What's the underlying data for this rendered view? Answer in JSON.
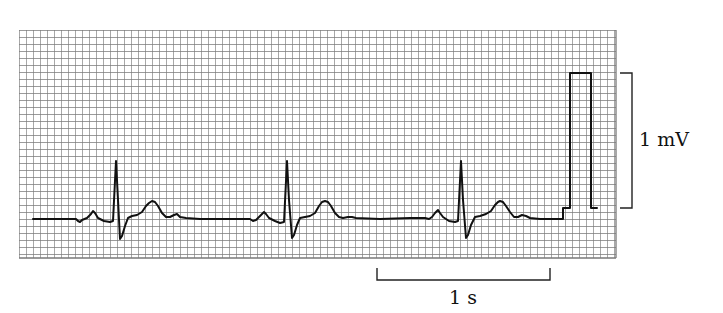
{
  "chart_data": {
    "type": "line",
    "title": "",
    "xlabel": "",
    "ylabel": "",
    "grid": true,
    "grid_spacing_px": 7,
    "paper_speed": "25 mm/s (1 s = 25 small boxes)",
    "annotations": [
      {
        "id": "voltage_scale",
        "text": "1 mV",
        "bracket": "vertical",
        "span_px": [
          73,
          208
        ]
      },
      {
        "id": "time_scale",
        "text": "1 s",
        "bracket": "horizontal",
        "span_px": [
          377,
          550
        ]
      }
    ],
    "beats": [
      {
        "index": 1,
        "P": [
          93,
          211
        ],
        "R": [
          116,
          161
        ],
        "S": [
          120,
          239
        ],
        "T": [
          152,
          201
        ]
      },
      {
        "index": 2,
        "P": [
          264,
          212
        ],
        "R": [
          287,
          161
        ],
        "S": [
          292,
          238
        ],
        "T": [
          325,
          201
        ]
      },
      {
        "index": 3,
        "P": [
          438,
          210
        ],
        "R": [
          461,
          161
        ],
        "S": [
          466,
          238
        ],
        "T": [
          500,
          201
        ]
      }
    ],
    "calibration_pulse": {
      "x_start": 570,
      "x_end": 591,
      "baseline_y": 208,
      "top_y": 73,
      "amplitude": "1 mV"
    },
    "rr_interval_px": 172,
    "trace_points": [
      [
        33,
        219
      ],
      [
        60,
        219
      ],
      [
        76,
        219
      ],
      [
        78,
        221
      ],
      [
        80,
        222
      ],
      [
        82,
        220
      ],
      [
        87,
        218
      ],
      [
        91,
        214
      ],
      [
        93,
        211
      ],
      [
        95,
        213
      ],
      [
        98,
        218
      ],
      [
        104,
        221
      ],
      [
        110,
        222
      ],
      [
        113,
        221
      ],
      [
        116,
        161
      ],
      [
        118,
        200
      ],
      [
        120,
        239
      ],
      [
        122,
        236
      ],
      [
        125,
        226
      ],
      [
        128,
        218
      ],
      [
        132,
        216
      ],
      [
        137,
        215
      ],
      [
        142,
        212
      ],
      [
        146,
        206
      ],
      [
        149,
        203
      ],
      [
        152,
        201
      ],
      [
        155,
        202
      ],
      [
        158,
        206
      ],
      [
        162,
        213
      ],
      [
        166,
        217
      ],
      [
        170,
        217
      ],
      [
        174,
        215
      ],
      [
        177,
        214
      ],
      [
        180,
        217
      ],
      [
        186,
        218
      ],
      [
        200,
        219
      ],
      [
        230,
        219
      ],
      [
        250,
        219
      ],
      [
        253,
        221
      ],
      [
        256,
        220
      ],
      [
        260,
        216
      ],
      [
        264,
        212
      ],
      [
        266,
        214
      ],
      [
        269,
        218
      ],
      [
        275,
        221
      ],
      [
        280,
        223
      ],
      [
        284,
        222
      ],
      [
        287,
        161
      ],
      [
        289,
        200
      ],
      [
        292,
        238
      ],
      [
        294,
        235
      ],
      [
        297,
        225
      ],
      [
        300,
        218
      ],
      [
        305,
        217
      ],
      [
        310,
        216
      ],
      [
        315,
        213
      ],
      [
        319,
        206
      ],
      [
        322,
        202
      ],
      [
        325,
        201
      ],
      [
        328,
        202
      ],
      [
        331,
        206
      ],
      [
        335,
        213
      ],
      [
        339,
        217
      ],
      [
        343,
        218
      ],
      [
        348,
        217
      ],
      [
        352,
        217
      ],
      [
        356,
        218
      ],
      [
        380,
        219
      ],
      [
        410,
        218
      ],
      [
        425,
        218
      ],
      [
        429,
        219
      ],
      [
        432,
        217
      ],
      [
        435,
        213
      ],
      [
        438,
        210
      ],
      [
        440,
        213
      ],
      [
        443,
        217
      ],
      [
        449,
        221
      ],
      [
        455,
        222
      ],
      [
        458,
        221
      ],
      [
        461,
        161
      ],
      [
        463,
        200
      ],
      [
        466,
        238
      ],
      [
        468,
        235
      ],
      [
        471,
        225
      ],
      [
        475,
        217
      ],
      [
        480,
        216
      ],
      [
        486,
        214
      ],
      [
        491,
        211
      ],
      [
        495,
        205
      ],
      [
        498,
        202
      ],
      [
        500,
        201
      ],
      [
        503,
        202
      ],
      [
        506,
        206
      ],
      [
        510,
        212
      ],
      [
        514,
        217
      ],
      [
        518,
        217
      ],
      [
        522,
        215
      ],
      [
        526,
        216
      ],
      [
        530,
        218
      ],
      [
        540,
        219
      ],
      [
        555,
        219
      ],
      [
        563,
        219
      ],
      [
        563,
        208
      ],
      [
        570,
        208
      ],
      [
        570,
        73
      ],
      [
        591,
        73
      ],
      [
        591,
        208
      ],
      [
        597,
        208
      ]
    ]
  },
  "labels": {
    "voltage": "1 mV",
    "time": "1 s"
  },
  "colors": {
    "background": "#ffffff",
    "grid_line": "#7a7a7a",
    "trace": "#111111",
    "annotation": "#222222"
  }
}
